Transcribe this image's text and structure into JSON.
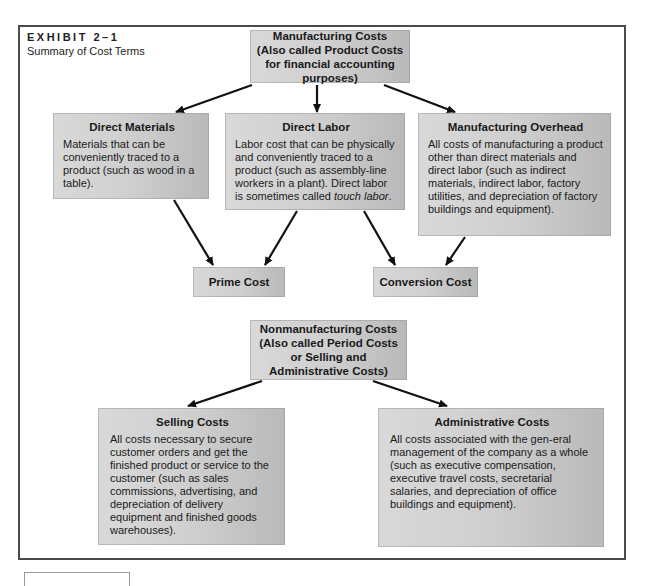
{
  "exhibit": {
    "label": "EXHIBIT 2–1",
    "subtitle": "Summary of Cost Terms"
  },
  "nodes": {
    "manufacturing_costs": {
      "line1": "Manufacturing Costs",
      "line2": "(Also called Product Costs",
      "line3": "for financial accounting purposes)"
    },
    "direct_materials": {
      "title": "Direct Materials",
      "body": "Materials that can be conveniently traced to a product (such as wood in a table)."
    },
    "direct_labor": {
      "title": "Direct Labor",
      "body_prefix": "Labor cost that can be physically and conveniently traced to a product (such as assembly-line workers in a plant). Direct labor is sometimes called ",
      "body_italic": "touch labor",
      "body_suffix": "."
    },
    "manufacturing_overhead": {
      "title": "Manufacturing Overhead",
      "body": "All costs of manufacturing a product other than direct materials and direct labor (such as indirect materials, indirect labor, factory utilities, and depreciation of factory buildings and equipment)."
    },
    "prime_cost": {
      "title": "Prime Cost"
    },
    "conversion_cost": {
      "title": "Conversion Cost"
    },
    "nonmanufacturing_costs": {
      "line1": "Nonmanufacturing Costs",
      "line2": "(Also called Period Costs",
      "line3": "or Selling and",
      "line4": "Administrative Costs)"
    },
    "selling_costs": {
      "title": "Selling Costs",
      "body": "All costs necessary to secure customer orders and get the finished product or service to the customer (such as sales commissions, advertising, and depreciation of delivery equipment and finished goods warehouses)."
    },
    "administrative_costs": {
      "title": "Administrative Costs",
      "body": "All costs associated with the gen-eral management of the company as a whole (such as executive compensation, executive travel costs, secretarial salaries, and depreciation of office buildings and equipment)."
    }
  },
  "edges": [
    {
      "from": "manufacturing_costs",
      "to": "direct_materials"
    },
    {
      "from": "manufacturing_costs",
      "to": "direct_labor"
    },
    {
      "from": "manufacturing_costs",
      "to": "manufacturing_overhead"
    },
    {
      "from": "direct_materials",
      "to": "prime_cost"
    },
    {
      "from": "direct_labor",
      "to": "prime_cost"
    },
    {
      "from": "direct_labor",
      "to": "conversion_cost"
    },
    {
      "from": "manufacturing_overhead",
      "to": "conversion_cost"
    },
    {
      "from": "nonmanufacturing_costs",
      "to": "selling_costs"
    },
    {
      "from": "nonmanufacturing_costs",
      "to": "administrative_costs"
    }
  ],
  "colors": {
    "box_fill_light": "#d9d9d9",
    "box_fill_dark": "#b9b9b9",
    "arrow": "#111111",
    "frame": "#4a4a4a"
  }
}
